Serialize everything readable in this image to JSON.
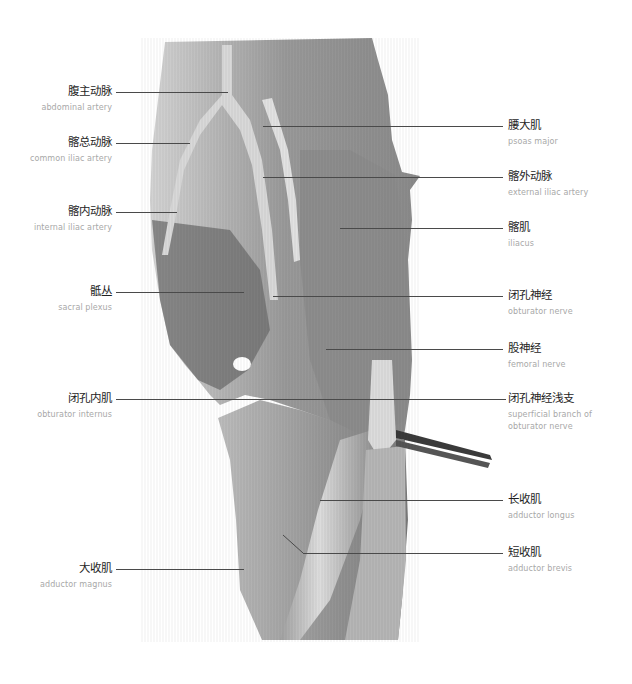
{
  "figure": {
    "line_color": "#4a4a4a",
    "cn_text_color": "#1e1e1e",
    "en_text_color": "#a8a8a8",
    "labels_left": [
      {
        "cn": "腹主动脉",
        "en": "abdominal artery",
        "y": 92
      },
      {
        "cn": "髂总动脉",
        "en": "common iliac artery",
        "y": 143
      },
      {
        "cn": "髂内动脉",
        "en": "internal iliac artery",
        "y": 212
      },
      {
        "cn": "骶丛",
        "en": "sacral plexus",
        "y": 292
      },
      {
        "cn": "闭孔内肌",
        "en": "obturator internus",
        "y": 399
      },
      {
        "cn": "大收肌",
        "en": "adductor magnus",
        "y": 569
      }
    ],
    "labels_right": [
      {
        "cn": "腰大肌",
        "en": "psoas major",
        "y": 126
      },
      {
        "cn": "髂外动脉",
        "en": "external iliac artery",
        "y": 177
      },
      {
        "cn": "髂肌",
        "en": "iliacus",
        "y": 228
      },
      {
        "cn": "闭孔神经",
        "en": "obturator nerve",
        "y": 296
      },
      {
        "cn": "股神经",
        "en": "femoral nerve",
        "y": 349
      },
      {
        "cn": "闭孔神经浅支",
        "en": "superficial branch of obturator nerve",
        "en_lines": [
          "superficial branch of",
          "obturator nerve"
        ],
        "y": 399
      },
      {
        "cn": "长收肌",
        "en": "adductor longus",
        "y": 500
      },
      {
        "cn": "短收肌",
        "en": "adductor brevis",
        "y": 553
      }
    ]
  }
}
